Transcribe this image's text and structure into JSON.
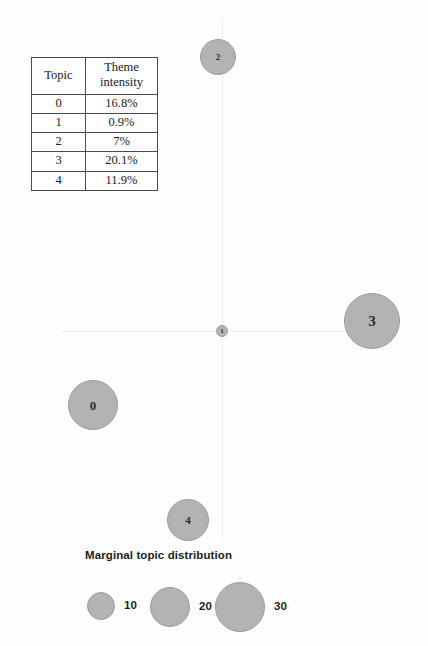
{
  "chart_data": {
    "type": "scatter",
    "title": "",
    "xlabel": "",
    "ylabel": "",
    "grid": false,
    "axes": {
      "origin_x": 222,
      "origin_y": 331,
      "show_x_axis": true,
      "show_y_axis": true
    },
    "size_encoding": "Marginal topic distribution",
    "points": [
      {
        "label": "0",
        "x": 93,
        "y": 405,
        "r": 25,
        "marginal_topic_distribution": 16.8
      },
      {
        "label": "1",
        "x": 222,
        "y": 331,
        "r": 6,
        "marginal_topic_distribution": 0.9
      },
      {
        "label": "2",
        "x": 218,
        "y": 57,
        "r": 18,
        "marginal_topic_distribution": 7
      },
      {
        "label": "3",
        "x": 372,
        "y": 321,
        "r": 28,
        "marginal_topic_distribution": 20.1
      },
      {
        "label": "4",
        "x": 188,
        "y": 520,
        "r": 21,
        "marginal_topic_distribution": 11.9
      }
    ],
    "legend": {
      "position": "bottom-left",
      "title": "Marginal topic distribution",
      "entries": [
        {
          "label": "10",
          "value": 10,
          "cx": 101,
          "cy": 606,
          "r": 14,
          "label_x": 124
        },
        {
          "label": "20",
          "value": 20,
          "cx": 170,
          "cy": 607,
          "r": 20,
          "label_x": 199
        },
        {
          "label": "30",
          "value": 30,
          "cx": 240,
          "cy": 607,
          "r": 25,
          "label_x": 274
        }
      ]
    },
    "colors": {
      "bubble_fill": "#b3b3b3",
      "bubble_stroke": "#9d9d9d",
      "axis": "#ededed",
      "text": "#1d1d1d",
      "background": "#ffffff"
    }
  },
  "table": {
    "headers": [
      "Topic",
      "Theme",
      "intensity"
    ],
    "header_topic": "Topic",
    "header_value_line1": "Theme",
    "header_value_line2": "intensity",
    "rows": [
      {
        "topic": "0",
        "intensity": "16.8%"
      },
      {
        "topic": "1",
        "intensity": "0.9%"
      },
      {
        "topic": "2",
        "intensity": "7%"
      },
      {
        "topic": "3",
        "intensity": "20.1%"
      },
      {
        "topic": "4",
        "intensity": "11.9%"
      }
    ]
  },
  "legend": {
    "title": "Marginal topic distribution",
    "entries": [
      {
        "label": "10"
      },
      {
        "label": "20"
      },
      {
        "label": "30"
      }
    ]
  }
}
